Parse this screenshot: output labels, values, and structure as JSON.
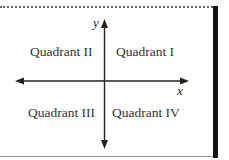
{
  "diagram": {
    "title": "",
    "axes": {
      "x_label": "x",
      "y_label": "y",
      "color": "#222222"
    },
    "quadrants": [
      {
        "id": "I",
        "label": "Quadrant I"
      },
      {
        "id": "II",
        "label": "Quadrant II"
      },
      {
        "id": "III",
        "label": "Quadrant III"
      },
      {
        "id": "IV",
        "label": "Quadrant IV"
      }
    ]
  }
}
